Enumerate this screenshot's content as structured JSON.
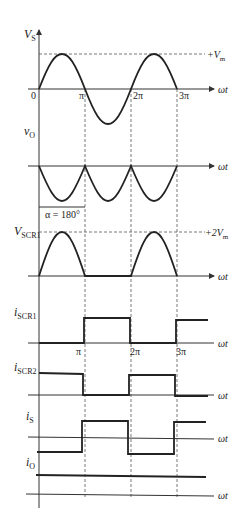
{
  "diagram": {
    "axis_label": "ωt",
    "ticks": [
      "0",
      "π",
      "2π",
      "3π"
    ],
    "panels": [
      {
        "id": "vs",
        "label": "V",
        "sub": "S",
        "annotation": "+V",
        "annotation_sub": "m"
      },
      {
        "id": "vo",
        "label": "v",
        "sub": "O"
      },
      {
        "id": "vscr1",
        "label": "V",
        "sub": "SCR1",
        "annotation": "+2V",
        "annotation_sub": "m",
        "alpha_label": "α = 180°"
      },
      {
        "id": "iscr1",
        "label": "i",
        "sub": "SCR1"
      },
      {
        "id": "iscr2",
        "label": "i",
        "sub": "SCR2"
      },
      {
        "id": "is",
        "label": "i",
        "sub": "S"
      },
      {
        "id": "io",
        "label": "i",
        "sub": "O"
      }
    ]
  }
}
